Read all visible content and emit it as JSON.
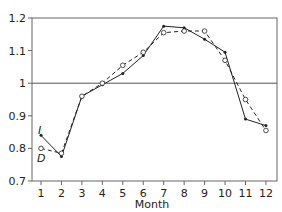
{
  "chart_data": {
    "type": "line",
    "title": "",
    "xlabel": "Month",
    "ylabel": "",
    "x": [
      1,
      2,
      3,
      4,
      5,
      6,
      7,
      8,
      9,
      10,
      11,
      12
    ],
    "xticks": [
      "1",
      "2",
      "3",
      "4",
      "5",
      "6",
      "7",
      "8",
      "9",
      "10",
      "11",
      "12"
    ],
    "ylim": [
      0.7,
      1.2
    ],
    "yticks": [
      "0.7",
      "0.8",
      "0.9",
      "1",
      "1.1",
      "1.2"
    ],
    "reference_line": 1.0,
    "grid": false,
    "series": [
      {
        "name": "I",
        "style": "solid",
        "marker": "dot",
        "values": [
          0.84,
          0.775,
          0.96,
          0.995,
          1.03,
          1.085,
          1.175,
          1.17,
          1.135,
          1.095,
          0.89,
          0.87
        ]
      },
      {
        "name": "D",
        "style": "dashed",
        "marker": "open-circle",
        "values": [
          0.8,
          0.785,
          0.96,
          1.0,
          1.055,
          1.095,
          1.155,
          1.16,
          1.16,
          1.07,
          0.95,
          0.855
        ]
      }
    ],
    "annotations": [
      {
        "text": "I",
        "near": "series I, month 1"
      },
      {
        "text": "D",
        "near": "series D, month 1"
      }
    ],
    "colors": {
      "line": "#222222",
      "axis": "#555555"
    }
  }
}
